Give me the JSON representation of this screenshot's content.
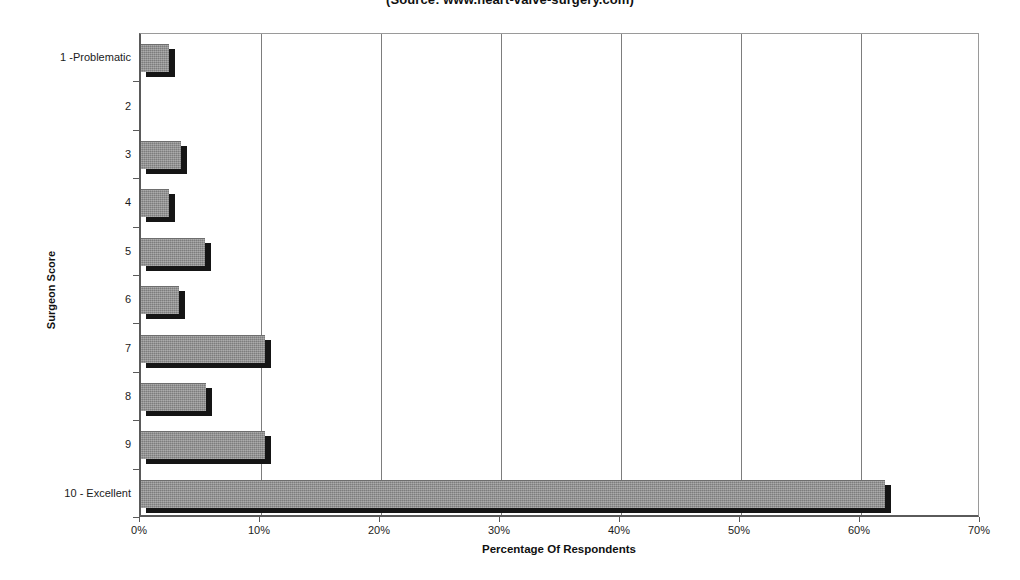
{
  "chart_data": {
    "type": "bar",
    "orientation": "horizontal",
    "title": "(Source: www.heart-valve-surgery.com)",
    "xlabel": "Percentage Of Respondents",
    "ylabel": "Surgeon Score",
    "categories": [
      "1 -Problematic",
      "2",
      "3",
      "4",
      "5",
      "6",
      "7",
      "8",
      "9",
      "10 - Excellent"
    ],
    "values": [
      2.3,
      0,
      3.3,
      2.3,
      5.3,
      3.2,
      10.3,
      5.4,
      10.3,
      62.0
    ],
    "xlim": [
      0,
      70
    ],
    "ylim": null,
    "xticks": [
      0,
      10,
      20,
      30,
      40,
      50,
      60,
      70
    ],
    "xtick_labels": [
      "0%",
      "10%",
      "20%",
      "30%",
      "40%",
      "50%",
      "60%",
      "70%"
    ],
    "grid": "vertical",
    "legend": null,
    "bar_color": "#8c8c8c",
    "shadow_color": "#151515",
    "gridline_color": "#7d7d7d",
    "axis_color": "#5a5a5a",
    "background": "#ffffff"
  }
}
